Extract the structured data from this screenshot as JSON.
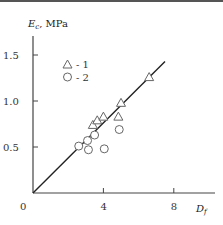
{
  "chart_data": {
    "type": "scatter",
    "title": "",
    "xlabel": "Df",
    "ylabel": "Ec, MPa",
    "xlim": [
      0,
      10
    ],
    "ylim": [
      0,
      1.8
    ],
    "x_ticks": [
      0,
      4,
      8
    ],
    "x_tick_labels": [
      "0",
      "4",
      "8"
    ],
    "y_ticks": [
      0.5,
      1.0,
      1.5
    ],
    "y_tick_labels": [
      "0.5",
      "1.0",
      "1.5"
    ],
    "grid": false,
    "legend": {
      "position": "upper-left",
      "entries": [
        "△ - 1",
        "○ - 2"
      ]
    },
    "series": [
      {
        "name": "1",
        "marker": "triangle",
        "points": [
          [
            3.4,
            0.74
          ],
          [
            3.65,
            0.79
          ],
          [
            4.0,
            0.83
          ],
          [
            4.85,
            0.83
          ],
          [
            5.0,
            0.98
          ],
          [
            6.6,
            1.26
          ]
        ]
      },
      {
        "name": "2",
        "marker": "circle",
        "points": [
          [
            2.6,
            0.51
          ],
          [
            3.1,
            0.57
          ],
          [
            3.15,
            0.47
          ],
          [
            3.5,
            0.63
          ],
          [
            4.05,
            0.48
          ],
          [
            4.9,
            0.69
          ]
        ]
      }
    ],
    "fit_line": {
      "from": [
        0,
        0
      ],
      "to": [
        7.5,
        1.43
      ],
      "style": "solid"
    }
  },
  "axis": {
    "y_label_main": "E",
    "y_label_sub": "c",
    "y_label_unit": ", MPa",
    "x_label_main": "D",
    "x_label_sub": "f",
    "origin_label": "0"
  },
  "legend": {
    "entry1": "- 1",
    "entry2": "- 2"
  }
}
